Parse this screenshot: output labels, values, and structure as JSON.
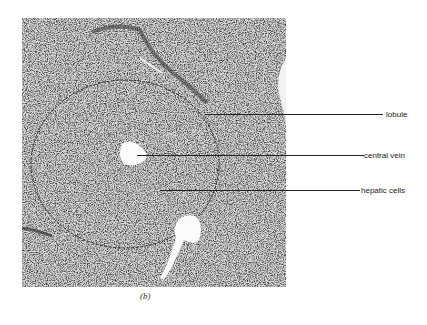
{
  "figure": {
    "caption": "(b)",
    "labels": [
      {
        "text": "lobule",
        "y": 115
      },
      {
        "text": "central vein",
        "y": 156
      },
      {
        "text": "hepatic cells",
        "y": 191
      }
    ]
  }
}
